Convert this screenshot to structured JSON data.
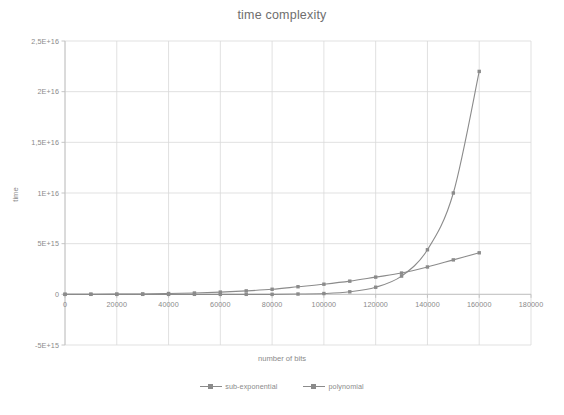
{
  "chart_data": {
    "type": "line",
    "title": "time complexity",
    "xlabel": "number of bits",
    "ylabel": "time",
    "xlim": [
      0,
      180000
    ],
    "ylim": [
      -5000000000000000,
      25000000000000000
    ],
    "grid": true,
    "legend_position": "bottom",
    "x_tick_labels": [
      "0",
      "20000",
      "40000",
      "60000",
      "80000",
      "100000",
      "120000",
      "140000",
      "160000",
      "180000"
    ],
    "x_tick_values": [
      0,
      20000,
      40000,
      60000,
      80000,
      100000,
      120000,
      140000,
      160000,
      180000
    ],
    "y_tick_labels": [
      "-5E+15",
      "0",
      "5E+15",
      "1E+16",
      "1,5E+16",
      "2E+16",
      "2,5E+16"
    ],
    "y_tick_values": [
      -5000000000000000,
      0,
      5000000000000000,
      10000000000000000,
      15000000000000000,
      20000000000000000,
      25000000000000000
    ],
    "x": [
      0,
      10000,
      20000,
      30000,
      40000,
      50000,
      60000,
      70000,
      80000,
      90000,
      100000,
      110000,
      120000,
      130000,
      140000,
      150000,
      160000
    ],
    "series": [
      {
        "name": "sub-exponential",
        "color": "#8b8b8b",
        "marker": "square",
        "values": [
          0,
          0,
          0,
          0,
          0,
          0,
          0,
          0,
          0,
          30000000000000,
          80000000000000,
          250000000000000,
          700000000000000,
          1800000000000000,
          4400000000000000,
          10000000000000000,
          22000000000000000
        ]
      },
      {
        "name": "polynomial",
        "color": "#8b8b8b",
        "marker": "square",
        "values": [
          0,
          10000000000000,
          20000000000000,
          40000000000000,
          80000000000000,
          130000000000000,
          220000000000000,
          340000000000000,
          500000000000000,
          750000000000000,
          1000000000000000,
          1300000000000000,
          1700000000000000,
          2100000000000000,
          2700000000000000,
          3400000000000000,
          4100000000000000
        ]
      }
    ]
  },
  "colors": {
    "series_line": "#8b8b8b",
    "grid": "#d9d9d9",
    "axis": "#bfbfbf",
    "text": "#8a8a8a",
    "title": "#6e6e6e",
    "background": "#ffffff"
  },
  "legend": {
    "items": [
      {
        "label": "sub-exponential"
      },
      {
        "label": "polynomial"
      }
    ]
  }
}
